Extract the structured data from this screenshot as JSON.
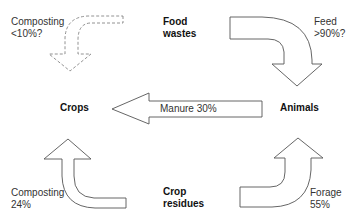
{
  "diagram": {
    "nodes": {
      "food_wastes": "Food\nwastes",
      "crops": "Crops",
      "animals": "Animals",
      "crop_residues": "Crop\nresidues"
    },
    "flows": {
      "composting_food": {
        "label": "Composting\n<10%?",
        "from": "Food wastes",
        "to": "Crops",
        "style": "dashed"
      },
      "feed": {
        "label": "Feed\n>90%?",
        "from": "Food wastes",
        "to": "Animals",
        "style": "solid"
      },
      "manure": {
        "label": "Manure 30%",
        "from": "Animals",
        "to": "Crops",
        "style": "solid"
      },
      "composting_residues": {
        "label": "Composting\n24%",
        "from": "Crop residues",
        "to": "Crops",
        "style": "solid"
      },
      "forage": {
        "label": "Forage\n55%",
        "from": "Crop residues",
        "to": "Animals",
        "style": "solid"
      }
    },
    "colors": {
      "stroke": "#555555",
      "fill": "#ffffff",
      "text": "#333333"
    }
  }
}
